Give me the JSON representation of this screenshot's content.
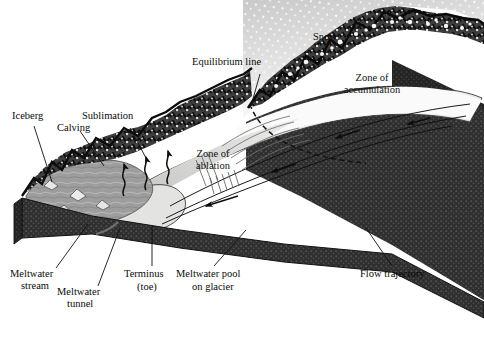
{
  "diagram": {
    "type": "block-diagram",
    "background": "#ffffff",
    "ink": "#0a0a0a"
  },
  "labels": {
    "iceberg": "Iceberg",
    "calving": "Calving",
    "sublimation": "Sublimation",
    "equilibrium_line": "Equilibrium line",
    "snow": "Snow",
    "zone_accumulation_l1": "Zone of",
    "zone_accumulation_l2": "accumulation",
    "zone_ablation_l1": "Zone of",
    "zone_ablation_l2": "ablation",
    "meltwater_stream_l1": "Meltwater",
    "meltwater_stream_l2": "stream",
    "meltwater_tunnel_l1": "Meltwater",
    "meltwater_tunnel_l2": "tunnel",
    "terminus_l1": "Terminus",
    "terminus_l2": "(toe)",
    "meltwater_pool_l1": "Meltwater pool",
    "meltwater_pool_l2": "on glacier",
    "flow_trajectory": "Flow trajectory"
  },
  "colors": {
    "rock_dark": "#1b1b1b",
    "rock_mid": "#4a4a4a",
    "block_side": "#3a3a3a",
    "block_front": "#2e2e2e",
    "ice_light": "#e2e2e0",
    "ice_mid": "#cfcfcd",
    "snow_white": "#fbfbfb",
    "water_gray": "#9a9a9a",
    "leader": "#111111"
  },
  "features": {
    "equilibrium_line_style": "dashed",
    "flow_arrow_direction": "downslope-left",
    "sublimation_arrows": 3,
    "snow_fall": "white-stipple"
  }
}
